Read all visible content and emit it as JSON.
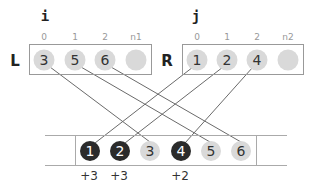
{
  "diagram": {
    "left": {
      "pointer": "i",
      "label": "L",
      "indices": [
        "0",
        "1",
        "2",
        "n1"
      ],
      "values": [
        "3",
        "5",
        "6",
        ""
      ]
    },
    "right": {
      "pointer": "j",
      "label": "R",
      "indices": [
        "0",
        "1",
        "2",
        "n2"
      ],
      "values": [
        "1",
        "2",
        "4",
        ""
      ]
    },
    "merged": {
      "values": [
        "1",
        "2",
        "3",
        "4",
        "5",
        "6"
      ],
      "highlighted": [
        true,
        true,
        false,
        true,
        false,
        false
      ],
      "deltas": [
        "+3",
        "+3",
        "",
        "+2",
        "",
        ""
      ]
    },
    "connections": [
      {
        "from": "L0",
        "to": "M2"
      },
      {
        "from": "L1",
        "to": "M4"
      },
      {
        "from": "L2",
        "to": "M5"
      },
      {
        "from": "R0",
        "to": "M0"
      },
      {
        "from": "R1",
        "to": "M1"
      },
      {
        "from": "R2",
        "to": "M3"
      }
    ],
    "colors": {
      "light_circle": "#d9d9d9",
      "dark_circle": "#2b2b2b",
      "box_stroke": "#999999",
      "line_stroke": "#666666"
    }
  }
}
